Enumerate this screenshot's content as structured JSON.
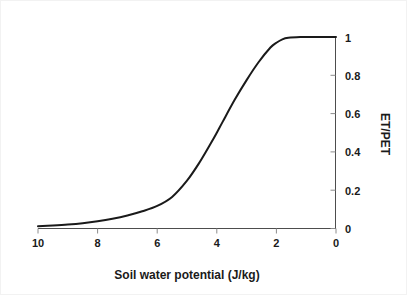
{
  "chart_data": {
    "type": "line",
    "title": "",
    "xlabel": "Soil water potential (J/kg)",
    "ylabel": "ET/PET",
    "xlim": [
      10,
      0
    ],
    "ylim": [
      0,
      1
    ],
    "x_axis_reversed": true,
    "grid": false,
    "legend": "none",
    "y_axis_position": "right",
    "xticks": [
      "10",
      "8",
      "6",
      "4",
      "2",
      "0"
    ],
    "xtick_values": [
      10,
      8,
      6,
      4,
      2,
      0
    ],
    "yticks": [
      "0",
      "0.2",
      "0.4",
      "0.6",
      "0.8",
      "1"
    ],
    "ytick_values": [
      0,
      0.2,
      0.4,
      0.6,
      0.8,
      1
    ],
    "series": [
      {
        "name": "ET/PET",
        "color": "#1a1a1a",
        "x": [
          10.0,
          9.5,
          9.0,
          8.5,
          8.0,
          7.5,
          7.0,
          6.5,
          6.0,
          5.5,
          5.0,
          4.6,
          4.2,
          4.0,
          3.8,
          3.4,
          3.0,
          2.6,
          2.2,
          2.0,
          1.8,
          1.6,
          1.2,
          0.8,
          0.4,
          0.0
        ],
        "y": [
          0.012,
          0.016,
          0.021,
          0.028,
          0.038,
          0.051,
          0.068,
          0.09,
          0.118,
          0.165,
          0.25,
          0.34,
          0.445,
          0.5,
          0.558,
          0.672,
          0.775,
          0.868,
          0.945,
          0.97,
          0.988,
          0.996,
          1.0,
          1.0,
          1.0,
          1.0
        ]
      }
    ]
  },
  "axes": {
    "x_label": "Soil water potential (J/kg)",
    "y_label": "ET/PET",
    "x_tick_labels": [
      "10",
      "8",
      "6",
      "4",
      "2",
      "0"
    ],
    "y_tick_labels": [
      "1",
      "0.8",
      "0.6",
      "0.4",
      "0.2",
      "0"
    ]
  }
}
